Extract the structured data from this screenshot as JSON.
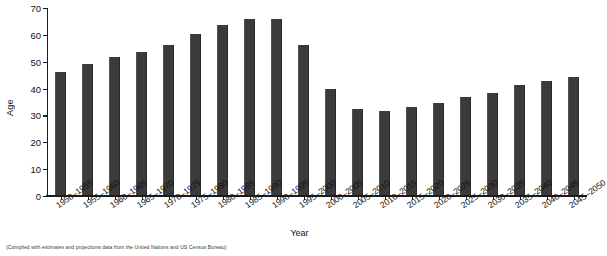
{
  "chart_data": {
    "type": "bar",
    "title": "",
    "xlabel": "Year",
    "ylabel": "Age",
    "ylim": [
      0,
      70
    ],
    "yticks": [
      0,
      10,
      20,
      30,
      40,
      50,
      60,
      70
    ],
    "grid": false,
    "legend": null,
    "bar_color": "#3b3b3b",
    "axis_color": "#1b1b1b",
    "background_color": "#ffffff",
    "categories": [
      "1950–1955",
      "1955–1960",
      "1960–1965",
      "1965–1970",
      "1970–1975",
      "1975–1980",
      "1980–1985",
      "1985–1990",
      "1990–1995",
      "1995–2000",
      "2000–2005",
      "2005–2010",
      "2010–2015",
      "2015–2020",
      "2020–2025",
      "2025–2030",
      "2030–2035",
      "2035–2040",
      "2040–2045",
      "2045–2050"
    ],
    "values": [
      46,
      49,
      51.5,
      53.5,
      56,
      60,
      63.5,
      65.5,
      65.5,
      56,
      39.5,
      32,
      31.5,
      33,
      34.5,
      36.5,
      38,
      41,
      42.5,
      44
    ]
  },
  "footnote": {
    "text": "(Compiled with estimates and projections data from the United Nations and US Census Bureau)"
  }
}
